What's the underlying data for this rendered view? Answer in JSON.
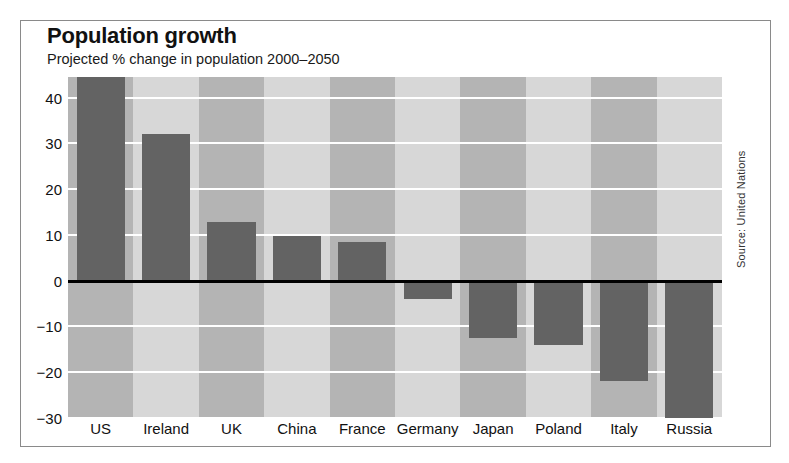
{
  "chart_data": {
    "type": "bar",
    "title": "Population growth",
    "subtitle": "Projected % change in population 2000–2050",
    "xlabel": "",
    "ylabel": "",
    "categories": [
      "US",
      "Ireland",
      "UK",
      "China",
      "France",
      "Germany",
      "Japan",
      "Poland",
      "Italy",
      "Russia"
    ],
    "values": [
      44.5,
      32,
      12.9,
      9.7,
      8.4,
      -4,
      -12.5,
      -14,
      -22,
      -30.5
    ],
    "ylim": [
      -30,
      44.5
    ],
    "yticks": [
      40,
      30,
      20,
      10,
      0,
      -10,
      -20,
      -30
    ],
    "ytick_labels": [
      "40",
      "30",
      "20",
      "10",
      "0",
      "−10",
      "−20",
      "−30"
    ],
    "grid": true,
    "legend": null,
    "source": "Source: United Nations",
    "colors": {
      "bar": "#636363",
      "band_dark": "#b4b4b4",
      "band_light": "#d7d7d7",
      "gridline": "#ffffff",
      "zeroline": "#000000",
      "frame": "#8a8a8a",
      "background": "#ffffff",
      "text": "#111111"
    }
  }
}
